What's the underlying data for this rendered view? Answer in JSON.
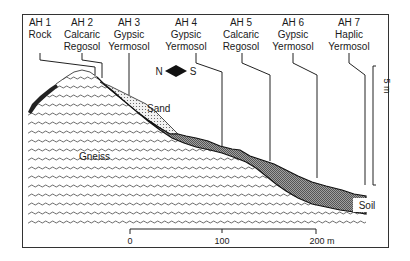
{
  "profiles": [
    {
      "id": "AH 1",
      "soil_line1": "Rock",
      "soil_line2": ""
    },
    {
      "id": "AH 2",
      "soil_line1": "Calcaric",
      "soil_line2": "Regosol"
    },
    {
      "id": "AH 3",
      "soil_line1": "Gypsic",
      "soil_line2": "Yermosol"
    },
    {
      "id": "AH 4",
      "soil_line1": "Gypsic",
      "soil_line2": "Yermosol"
    },
    {
      "id": "AH 5",
      "soil_line1": "Calcaric",
      "soil_line2": "Regosol"
    },
    {
      "id": "AH 6",
      "soil_line1": "Gypsic",
      "soil_line2": "Yermosol"
    },
    {
      "id": "AH 7",
      "soil_line1": "Haplic",
      "soil_line2": "Yermosol"
    }
  ],
  "orientation": {
    "north": "N",
    "south": "S"
  },
  "labels": {
    "sand": "Sand",
    "gneiss": "Gneiss",
    "soil": "Soil"
  },
  "vertical_scale": {
    "label": "5 m"
  },
  "horizontal_scale": {
    "ticks": [
      "0",
      "100",
      "200 m"
    ]
  },
  "colors": {
    "frame": "#333333",
    "soil_fill": "#8c8c8c",
    "sand_fill": "#e6e6e6",
    "line": "#1a1a1a"
  }
}
